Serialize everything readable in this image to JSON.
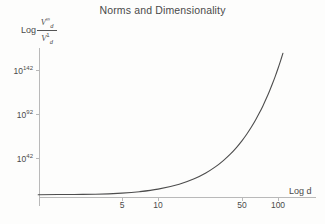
{
  "chart_data": {
    "type": "line",
    "title": "Norms and Dimensionality",
    "xlabel": "Log d",
    "ylabel": "Log V_d^inf / V_d^1",
    "ylabel_parts": {
      "log": "Log",
      "numerator_base": "V",
      "numerator_sub": "d",
      "numerator_sup": "∞",
      "denominator_base": "V",
      "denominator_sub": "d",
      "denominator_sup": "1"
    },
    "xscale": "log",
    "yscale": "log",
    "grid": false,
    "legend": null,
    "xticks": [
      {
        "label": "5",
        "value": 5
      },
      {
        "label": "10",
        "value": 10
      },
      {
        "label": "50",
        "value": 50
      },
      {
        "label": "100",
        "value": 100
      }
    ],
    "yticks": [
      {
        "label_base": "10",
        "label_exp": "42",
        "value": 42
      },
      {
        "label_base": "10",
        "label_exp": "92",
        "value": 92
      },
      {
        "label_base": "10",
        "label_exp": "142",
        "value": 142
      }
    ],
    "xlim": [
      1,
      130
    ],
    "ylim": [
      0,
      160
    ],
    "series": [
      {
        "name": "ratio of infinity-norm ball volume to 1-norm ball volume",
        "x": [
          1,
          2,
          3,
          5,
          7,
          10,
          15,
          20,
          25,
          30,
          35,
          40,
          45,
          50,
          55,
          60,
          65,
          70,
          75,
          80,
          85,
          90,
          95,
          100,
          105,
          110,
          115
        ],
        "y": [
          0.3,
          0.6,
          0.8,
          2.1,
          3.7,
          6.6,
          12.2,
          18.4,
          25.0,
          31.9,
          39.1,
          46.4,
          53.9,
          61.5,
          69.3,
          77.2,
          85.2,
          93.3,
          101.5,
          109.8,
          118.2,
          126.6,
          135.1,
          143.7,
          152.4,
          161.1,
          169.9
        ],
        "color": "#4d4d4d",
        "linewidth": 1.1
      }
    ],
    "axis_color": "#b9b9b9",
    "text_color": "#4a4a4a",
    "background": "#fdfdfc"
  }
}
